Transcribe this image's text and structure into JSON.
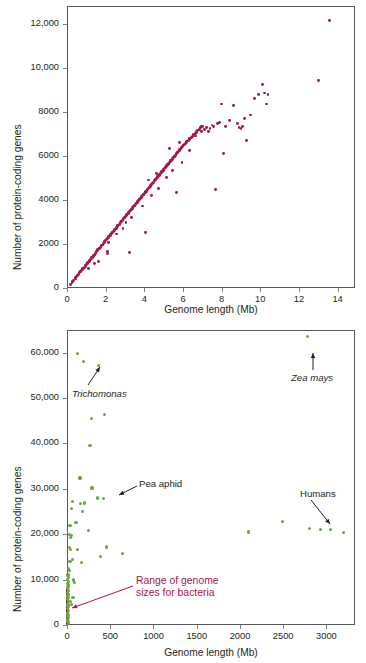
{
  "figure": {
    "colors": {
      "bacteria_points": "#a8184a",
      "eukaryote_points": "#6fa544",
      "annotation_red": "#a8184a",
      "axis": "#58595b",
      "text": "#231f20"
    }
  },
  "chart_data": [
    {
      "type": "scatter",
      "id": "bacteria",
      "title": "Bacteria",
      "xlabel": "Genome length (Mb)",
      "ylabel": "Number of protein-coding genes",
      "xlim": [
        0,
        14.9
      ],
      "ylim": [
        0,
        12800
      ],
      "xticks": [
        0,
        2,
        4,
        6,
        8,
        10,
        12,
        14
      ],
      "xticklabels": [
        "0",
        "2",
        "4",
        "6",
        "8",
        "10",
        "12",
        "14"
      ],
      "yticks": [
        0,
        2000,
        4000,
        6000,
        8000,
        10000,
        12000
      ],
      "yticklabels": [
        "0",
        "2000",
        "4000",
        "6000",
        "8000",
        "10,000",
        "12,000"
      ],
      "grid": false,
      "legend": "none",
      "marker_color": "#a8184a",
      "points": [
        [
          0.16,
          170
        ],
        [
          0.26,
          230
        ],
        [
          0.29,
          300
        ],
        [
          0.35,
          330
        ],
        [
          0.42,
          410
        ],
        [
          0.45,
          480
        ],
        [
          0.49,
          520
        ],
        [
          0.55,
          560
        ],
        [
          0.58,
          620
        ],
        [
          0.62,
          660
        ],
        [
          0.64,
          700
        ],
        [
          0.68,
          730
        ],
        [
          0.72,
          760
        ],
        [
          0.75,
          800
        ],
        [
          0.79,
          840
        ],
        [
          0.82,
          880
        ],
        [
          0.86,
          900
        ],
        [
          0.9,
          950
        ],
        [
          0.94,
          980
        ],
        [
          0.98,
          1020
        ],
        [
          1.02,
          1060
        ],
        [
          1.05,
          1100
        ],
        [
          1.08,
          1140
        ],
        [
          1.12,
          1180
        ],
        [
          1.15,
          1210
        ],
        [
          1.18,
          1250
        ],
        [
          1.22,
          1290
        ],
        [
          1.25,
          1330
        ],
        [
          1.28,
          1370
        ],
        [
          1.32,
          1400
        ],
        [
          1.35,
          1440
        ],
        [
          1.38,
          1480
        ],
        [
          1.42,
          1500
        ],
        [
          1.45,
          1540
        ],
        [
          1.48,
          1580
        ],
        [
          1.5,
          1630
        ],
        [
          1.54,
          1660
        ],
        [
          1.58,
          1700
        ],
        [
          1.6,
          1740
        ],
        [
          1.63,
          1190
        ],
        [
          1.66,
          1780
        ],
        [
          1.7,
          1810
        ],
        [
          1.73,
          1850
        ],
        [
          1.76,
          1880
        ],
        [
          1.8,
          1910
        ],
        [
          1.83,
          1950
        ],
        [
          1.86,
          1990
        ],
        [
          1.9,
          2020
        ],
        [
          1.93,
          2060
        ],
        [
          1.96,
          2100
        ],
        [
          2.0,
          2140
        ],
        [
          2.02,
          2180
        ],
        [
          2.05,
          2210
        ],
        [
          2.08,
          1640
        ],
        [
          2.1,
          2250
        ],
        [
          2.14,
          2280
        ],
        [
          2.17,
          2320
        ],
        [
          2.2,
          2360
        ],
        [
          2.24,
          2400
        ],
        [
          2.27,
          2430
        ],
        [
          2.3,
          2470
        ],
        [
          2.34,
          2500
        ],
        [
          2.36,
          2540
        ],
        [
          2.4,
          2570
        ],
        [
          2.44,
          2600
        ],
        [
          2.47,
          2640
        ],
        [
          2.5,
          2680
        ],
        [
          2.54,
          2710
        ],
        [
          2.57,
          2750
        ],
        [
          2.6,
          2780
        ],
        [
          2.63,
          2820
        ],
        [
          2.66,
          2860
        ],
        [
          2.7,
          2900
        ],
        [
          2.74,
          2930
        ],
        [
          2.77,
          2970
        ],
        [
          2.8,
          3000
        ],
        [
          2.83,
          3040
        ],
        [
          2.86,
          3070
        ],
        [
          2.9,
          3110
        ],
        [
          2.93,
          3150
        ],
        [
          2.97,
          3180
        ],
        [
          3.0,
          3220
        ],
        [
          3.04,
          3260
        ],
        [
          3.07,
          3290
        ],
        [
          3.1,
          3330
        ],
        [
          3.14,
          3360
        ],
        [
          3.17,
          3400
        ],
        [
          3.2,
          3430
        ],
        [
          3.24,
          3470
        ],
        [
          3.27,
          3510
        ],
        [
          3.3,
          3540
        ],
        [
          3.34,
          3580
        ],
        [
          3.37,
          3610
        ],
        [
          3.4,
          3650
        ],
        [
          3.44,
          3690
        ],
        [
          3.47,
          3720
        ],
        [
          3.5,
          3760
        ],
        [
          3.54,
          3790
        ],
        [
          3.57,
          3830
        ],
        [
          3.6,
          3860
        ],
        [
          3.64,
          3900
        ],
        [
          3.67,
          3940
        ],
        [
          3.7,
          3970
        ],
        [
          3.74,
          4010
        ],
        [
          3.77,
          4040
        ],
        [
          3.8,
          4080
        ],
        [
          3.84,
          4120
        ],
        [
          3.87,
          4150
        ],
        [
          3.9,
          4190
        ],
        [
          3.94,
          4220
        ],
        [
          3.97,
          4260
        ],
        [
          4.0,
          4300
        ],
        [
          4.04,
          4330
        ],
        [
          4.07,
          4370
        ],
        [
          4.1,
          4400
        ],
        [
          4.14,
          4440
        ],
        [
          4.17,
          4480
        ],
        [
          4.2,
          4510
        ],
        [
          4.24,
          4550
        ],
        [
          4.27,
          4580
        ],
        [
          4.3,
          4620
        ],
        [
          4.34,
          4660
        ],
        [
          4.37,
          4690
        ],
        [
          4.4,
          4730
        ],
        [
          4.44,
          4760
        ],
        [
          4.47,
          4800
        ],
        [
          4.5,
          4840
        ],
        [
          4.54,
          4870
        ],
        [
          4.57,
          4910
        ],
        [
          4.6,
          4940
        ],
        [
          4.64,
          4980
        ],
        [
          4.67,
          5010
        ],
        [
          4.7,
          5050
        ],
        [
          4.74,
          5090
        ],
        [
          4.77,
          5120
        ],
        [
          4.8,
          5160
        ],
        [
          4.84,
          5190
        ],
        [
          4.87,
          5230
        ],
        [
          4.9,
          5270
        ],
        [
          4.94,
          5300
        ],
        [
          4.97,
          5340
        ],
        [
          5.0,
          5370
        ],
        [
          5.04,
          5410
        ],
        [
          5.07,
          5450
        ],
        [
          5.1,
          5480
        ],
        [
          5.14,
          5520
        ],
        [
          5.17,
          5550
        ],
        [
          5.2,
          5590
        ],
        [
          5.24,
          5620
        ],
        [
          5.27,
          5660
        ],
        [
          5.3,
          5700
        ],
        [
          5.34,
          5730
        ],
        [
          5.37,
          5770
        ],
        [
          5.4,
          5800
        ],
        [
          5.44,
          5840
        ],
        [
          5.47,
          5880
        ],
        [
          5.5,
          5910
        ],
        [
          5.54,
          5950
        ],
        [
          5.57,
          5980
        ],
        [
          5.6,
          6020
        ],
        [
          5.64,
          6060
        ],
        [
          5.67,
          6090
        ],
        [
          5.7,
          6130
        ],
        [
          5.74,
          6160
        ],
        [
          5.77,
          6200
        ],
        [
          5.8,
          6240
        ],
        [
          5.84,
          6270
        ],
        [
          5.87,
          6310
        ],
        [
          5.9,
          6340
        ],
        [
          5.94,
          6380
        ],
        [
          5.97,
          6420
        ],
        [
          6.0,
          6450
        ],
        [
          6.04,
          6490
        ],
        [
          6.08,
          6520
        ],
        [
          6.12,
          6560
        ],
        [
          6.16,
          6600
        ],
        [
          6.2,
          6630
        ],
        [
          6.24,
          6670
        ],
        [
          6.28,
          6700
        ],
        [
          6.32,
          6740
        ],
        [
          6.36,
          6780
        ],
        [
          6.4,
          6810
        ],
        [
          6.44,
          6850
        ],
        [
          6.48,
          6880
        ],
        [
          6.52,
          6920
        ],
        [
          6.56,
          6960
        ],
        [
          6.6,
          6990
        ],
        [
          6.64,
          7030
        ],
        [
          6.68,
          7060
        ],
        [
          6.72,
          7100
        ],
        [
          6.76,
          7140
        ],
        [
          6.8,
          7170
        ],
        [
          6.84,
          7210
        ],
        [
          6.88,
          7240
        ],
        [
          6.92,
          7280
        ],
        [
          6.96,
          7320
        ],
        [
          7.0,
          7350
        ],
        [
          7.1,
          7200
        ],
        [
          7.2,
          7300
        ],
        [
          7.3,
          7100
        ],
        [
          7.4,
          7250
        ],
        [
          7.5,
          7400
        ],
        [
          7.6,
          7350
        ],
        [
          7.7,
          4480
        ],
        [
          7.8,
          7450
        ],
        [
          7.9,
          7500
        ],
        [
          8.0,
          8350
        ],
        [
          8.1,
          6100
        ],
        [
          8.2,
          7350
        ],
        [
          8.4,
          7600
        ],
        [
          8.6,
          8300
        ],
        [
          8.8,
          7450
        ],
        [
          8.9,
          7300
        ],
        [
          9.0,
          7250
        ],
        [
          9.1,
          7350
        ],
        [
          9.2,
          7700
        ],
        [
          9.3,
          6700
        ],
        [
          9.5,
          7850
        ],
        [
          9.7,
          8600
        ],
        [
          9.9,
          8800
        ],
        [
          10.1,
          9250
        ],
        [
          10.2,
          8850
        ],
        [
          10.3,
          8350
        ],
        [
          10.4,
          8800
        ],
        [
          13.0,
          9400
        ],
        [
          13.6,
          12150
        ],
        [
          1.1,
          870
        ],
        [
          1.4,
          1120
        ],
        [
          2.15,
          2050
        ],
        [
          2.55,
          2450
        ],
        [
          3.05,
          2980
        ],
        [
          3.35,
          3180
        ],
        [
          3.9,
          3720
        ],
        [
          4.05,
          2500
        ],
        [
          4.35,
          4180
        ],
        [
          4.75,
          4500
        ],
        [
          5.15,
          5000
        ],
        [
          5.45,
          5350
        ],
        [
          5.65,
          4350
        ],
        [
          5.95,
          5700
        ],
        [
          6.35,
          6250
        ],
        [
          6.65,
          6900
        ],
        [
          6.95,
          7100
        ],
        [
          3.25,
          1610
        ],
        [
          2.1,
          1550
        ],
        [
          5.3,
          6320
        ],
        [
          5.8,
          6600
        ],
        [
          4.65,
          5200
        ],
        [
          4.2,
          4900
        ],
        [
          2.9,
          2700
        ]
      ]
    },
    {
      "type": "scatter",
      "id": "eukaryotes",
      "title": "Eukaryotes",
      "xlabel": "Genome length (Mb)",
      "ylabel": "Number of protein-coding genes",
      "xlim": [
        0,
        3330
      ],
      "ylim": [
        0,
        65000
      ],
      "xticks": [
        0,
        500,
        1000,
        1500,
        2000,
        2500,
        3000
      ],
      "xticklabels": [
        "0",
        "500",
        "1000",
        "1500",
        "2000",
        "2500",
        "3000"
      ],
      "yticks": [
        0,
        10000,
        20000,
        30000,
        40000,
        50000,
        60000
      ],
      "yticklabels": [
        "0",
        "10,000",
        "20,000",
        "30,000",
        "40,000",
        "50,000",
        "60,000"
      ],
      "grid": false,
      "legend": "none",
      "marker_color": "#6fa544",
      "points": [
        [
          120,
          59800
        ],
        [
          190,
          58000
        ],
        [
          360,
          57100
        ],
        [
          2780,
          63500
        ],
        [
          285,
          45500
        ],
        [
          430,
          46400
        ],
        [
          265,
          39600
        ],
        [
          150,
          32400
        ],
        [
          60,
          27300
        ],
        [
          50,
          25700
        ],
        [
          155,
          26800
        ],
        [
          200,
          26900
        ],
        [
          290,
          30200
        ],
        [
          350,
          28000
        ],
        [
          420,
          27800
        ],
        [
          175,
          25000
        ],
        [
          105,
          22500
        ],
        [
          35,
          22000
        ],
        [
          30,
          20000
        ],
        [
          55,
          19700
        ],
        [
          40,
          19200
        ],
        [
          250,
          20900
        ],
        [
          25,
          17000
        ],
        [
          45,
          16700
        ],
        [
          120,
          16600
        ],
        [
          60,
          14500
        ],
        [
          35,
          14000
        ],
        [
          165,
          13700
        ],
        [
          390,
          15100
        ],
        [
          460,
          17200
        ],
        [
          640,
          15700
        ],
        [
          2100,
          20500
        ],
        [
          2490,
          22800
        ],
        [
          2800,
          21300
        ],
        [
          2930,
          21000
        ],
        [
          3050,
          21000
        ],
        [
          3200,
          20400
        ],
        [
          12,
          11000
        ],
        [
          10,
          10000
        ],
        [
          14,
          9600
        ],
        [
          8,
          9200
        ],
        [
          16,
          8800
        ],
        [
          11,
          8400
        ],
        [
          9,
          8000
        ],
        [
          13,
          7600
        ],
        [
          7,
          7200
        ],
        [
          15,
          6800
        ],
        [
          10,
          6400
        ],
        [
          12,
          6000
        ],
        [
          8,
          5600
        ],
        [
          14,
          5200
        ],
        [
          9,
          4800
        ],
        [
          11,
          4400
        ],
        [
          13,
          4000
        ],
        [
          7,
          3600
        ],
        [
          16,
          3200
        ],
        [
          10,
          2800
        ],
        [
          12,
          2400
        ],
        [
          9,
          2000
        ],
        [
          14,
          1600
        ],
        [
          8,
          1200
        ],
        [
          11,
          800
        ],
        [
          13,
          400
        ],
        [
          40,
          5200
        ],
        [
          55,
          4500
        ],
        [
          75,
          9900
        ],
        [
          90,
          9400
        ],
        [
          30,
          12000
        ],
        [
          22,
          12500
        ],
        [
          18,
          10500
        ],
        [
          70,
          6000
        ]
      ],
      "annotations": [
        {
          "id": "trichomonas",
          "label": "Trichomonas",
          "italic": true,
          "point": [
            120,
            59800
          ],
          "arrow": "up-right"
        },
        {
          "id": "zea-mays",
          "label": "Zea mays",
          "italic": true,
          "point": [
            2780,
            63500
          ],
          "arrow": "up"
        },
        {
          "id": "pea-aphid",
          "label": "Pea aphid",
          "italic": false,
          "point": [
            520,
            28000
          ],
          "arrow": "down-left"
        },
        {
          "id": "humans",
          "label": "Humans",
          "italic": false,
          "point": [
            3050,
            21000
          ],
          "arrow": "down-right"
        },
        {
          "id": "bacteria-range",
          "label": "Range of genome sizes for bacteria",
          "label_line1": "Range of genome",
          "label_line2": "sizes for bacteria",
          "italic": false,
          "color": "#a8184a",
          "point": [
            10,
            2500
          ],
          "arrow": "down-left"
        }
      ],
      "bacteria_range_bar": {
        "x": 10,
        "y_from": 0,
        "y_to": 8200,
        "color": "#8c1338"
      }
    }
  ]
}
